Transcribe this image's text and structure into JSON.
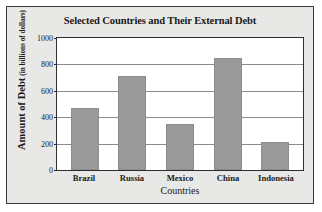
{
  "chart_data": {
    "type": "bar",
    "title": "Selected Countries and Their External Debt",
    "xlabel": "Countries",
    "ylabel": "Amount of Debt",
    "ylabel_units": "(in billions of dollars)",
    "categories": [
      "Brazil",
      "Russia",
      "Mexico",
      "China",
      "Indonesia"
    ],
    "values": [
      470,
      715,
      345,
      850,
      210
    ],
    "ylim": [
      0,
      1000
    ],
    "yticks": [
      0,
      200,
      400,
      600,
      800,
      1000
    ],
    "ytick_labels": [
      "0",
      "200",
      "400",
      "600",
      "800",
      "1000"
    ],
    "grid": true,
    "legend": false,
    "bar_color": "#9a9a9a",
    "plot_background": "#ffffff",
    "figure_background": "#e8e8e6",
    "axis_color": "#2d2d2d",
    "gridline_color": "#8a8a8a"
  }
}
